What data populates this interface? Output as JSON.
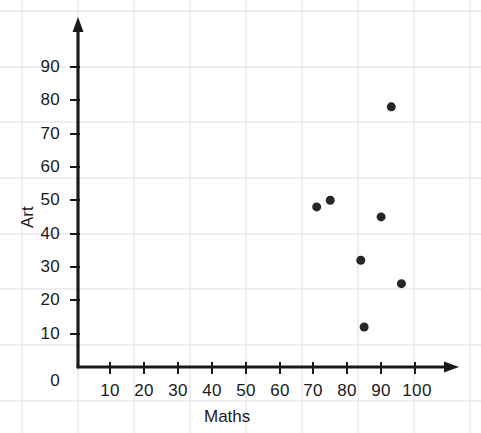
{
  "chart_data": {
    "type": "scatter",
    "title": "",
    "xlabel": "Maths",
    "ylabel": "Art",
    "xlim": [
      0,
      108
    ],
    "ylim": [
      0,
      98
    ],
    "xticks": [
      0,
      10,
      20,
      30,
      40,
      50,
      60,
      70,
      80,
      90,
      100
    ],
    "yticks": [
      0,
      10,
      20,
      30,
      40,
      50,
      60,
      70,
      80,
      90
    ],
    "xtick_labels": [
      "0",
      "10",
      "20",
      "30",
      "40",
      "50",
      "60",
      "70",
      "80",
      "90",
      "100"
    ],
    "ytick_labels": [
      "0",
      "10",
      "20",
      "30",
      "40",
      "50",
      "60",
      "70",
      "80",
      "90"
    ],
    "grid": true,
    "grid_color": "#c9c9d4",
    "legend": null,
    "marker_color": "#262626",
    "marker_size": 9,
    "axis_color": "#1a1a1a",
    "points": [
      {
        "x": 71,
        "y": 48
      },
      {
        "x": 75,
        "y": 50
      },
      {
        "x": 84,
        "y": 32
      },
      {
        "x": 85,
        "y": 12
      },
      {
        "x": 90,
        "y": 45
      },
      {
        "x": 93,
        "y": 78
      },
      {
        "x": 96,
        "y": 25
      }
    ]
  },
  "axes": {
    "x_title": "Maths",
    "y_title": "Art"
  }
}
